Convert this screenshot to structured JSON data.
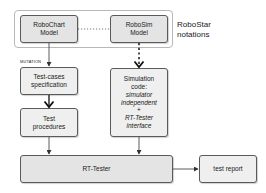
{
  "group": {
    "label_line1": "RoboStar",
    "label_line2": "notations"
  },
  "nodes": {
    "robochart": {
      "line1": "RoboChart",
      "line2": "Model"
    },
    "robosim": {
      "line1": "RoboSim",
      "line2": "Model"
    },
    "testcases": {
      "line1": "Test-cases",
      "line2": "specification"
    },
    "procedures": {
      "line1": "Test",
      "line2": "procedures"
    },
    "simcode": {
      "line1": "Simulation",
      "line2": "code:",
      "line3": "simulator",
      "line4": "independent",
      "line5": "+",
      "line6": "RT-Tester",
      "line7": "interface"
    },
    "rttester": {
      "label": "RT-Tester"
    },
    "report": {
      "label": "test report"
    }
  },
  "edges": {
    "mutation_label": "MUTATION"
  },
  "colors": {
    "node_fill": "#e4e4e4",
    "node_border": "#5a5a5a",
    "group_border": "#b8b8b8",
    "edge": "#333333"
  }
}
